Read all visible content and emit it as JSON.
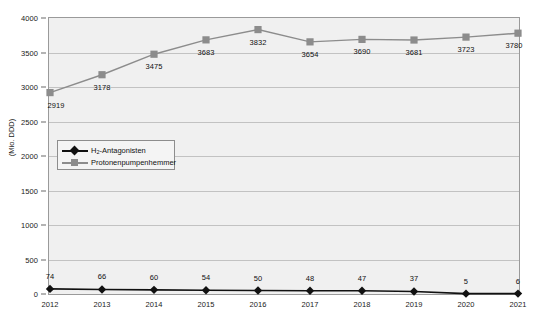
{
  "chart_data": {
    "type": "line",
    "title": "",
    "xlabel": "",
    "ylabel": "(Mio. DDD)",
    "categories": [
      "2012",
      "2013",
      "2014",
      "2015",
      "2016",
      "2017",
      "2018",
      "2019",
      "2020",
      "2021"
    ],
    "ylim": [
      0,
      4000
    ],
    "ytick_labels": [
      "0",
      "500",
      "1000",
      "1500",
      "2000",
      "2500",
      "3000",
      "3500",
      "4000"
    ],
    "ytick_values": [
      0,
      500,
      1000,
      1500,
      2000,
      2500,
      3000,
      3500,
      4000
    ],
    "grid": true,
    "legend_position": "inside-left-middle",
    "series": [
      {
        "name": "H2-Antagonisten",
        "name_html_base": "H",
        "name_html_sub": "2",
        "name_html_rest": "-Antagonisten",
        "color": "#111111",
        "marker": "diamond",
        "values": [
          74,
          66,
          60,
          54,
          50,
          48,
          47,
          37,
          5,
          6
        ],
        "labels": [
          "74",
          "66",
          "60",
          "54",
          "50",
          "48",
          "47",
          "37",
          "5",
          "6"
        ]
      },
      {
        "name": "Protonenpumpenhemmer",
        "color": "#8c8c8c",
        "marker": "square",
        "values": [
          2919,
          3178,
          3475,
          3683,
          3832,
          3654,
          3690,
          3681,
          3723,
          3780
        ],
        "labels": [
          "2919",
          "3178",
          "3475",
          "3683",
          "3832",
          "3654",
          "3690",
          "3681",
          "3723",
          "3780"
        ]
      }
    ]
  },
  "colors": {
    "plot_background": "#f0f0f0",
    "gridline": "#c2c2c2",
    "axis": "#6a6a6a",
    "series_dark": "#111111",
    "series_gray": "#8c8c8c",
    "text": "#111111"
  }
}
